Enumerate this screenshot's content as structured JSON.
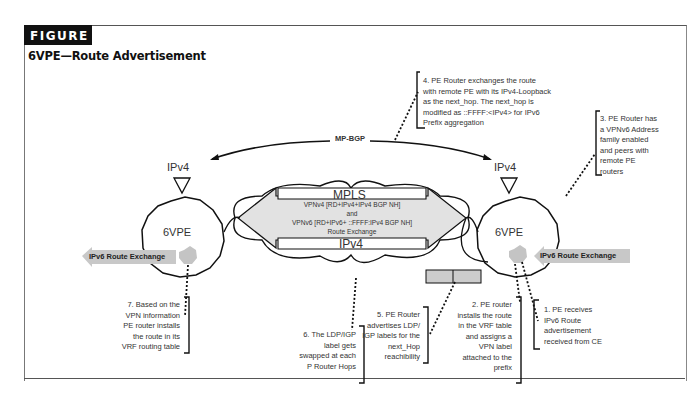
{
  "figure": {
    "tag": "FIGURE",
    "number": "4",
    "title": "6VPE—Route Advertisement"
  },
  "diagram": {
    "protocol_label": "MP-BGP",
    "left_router": {
      "name": "6VPE",
      "transport": "IPv4"
    },
    "right_router": {
      "name": "6VPE",
      "transport": "IPv4"
    },
    "core": {
      "top_label": "MPLS",
      "bottom_label": "IPv4",
      "center_lines": [
        "VPNv4 [RD+IPv4+IPv4 BGP NH]",
        "and",
        "VPNv6 [RD+IPv6+ ::FFFF:IPv4 BGP NH]",
        "Route Exchange"
      ]
    },
    "left_arrow": "IPv6 Route Exchange",
    "right_arrow": "IPv6 Route Exchange",
    "colors": {
      "line": "#111111",
      "arrow_fill": "#c8c8c8",
      "core_fill": "#e2e2e2",
      "dot_fill": "#c4c4c4",
      "label_box": "#cccccc"
    }
  },
  "notes": {
    "n1": [
      "1. PE receives",
      "IPv6 Route",
      "advertisement",
      "received from CE"
    ],
    "n2": [
      "2. PE router",
      "installs the route",
      "in the VRF table",
      "and assigns a",
      "VPN label",
      "attached to the",
      "prefix"
    ],
    "n3": [
      "3. PE Router has",
      "a VPNv6 Address",
      "family enabled",
      "and peers with",
      "remote PE",
      "routers"
    ],
    "n4": [
      "4. PE Router exchanges the route",
      "with remote PE with its IPv4-Loopback",
      "as the next_hop. The next_hop is",
      "modified as ::FFFF:<IPv4> for IPv6",
      "Prefix aggregation"
    ],
    "n5": [
      "5. PE Router",
      "advertises LDP/",
      "IGP labels for the",
      "next_Hop",
      "reachibility"
    ],
    "n6": [
      "6. The LDP/IGP",
      "label gets",
      "swapped at each",
      "P Router Hops"
    ],
    "n7": [
      "7. Based on the",
      "VPN information",
      "PE router installs",
      "the route in its",
      "VRF routing table"
    ]
  }
}
